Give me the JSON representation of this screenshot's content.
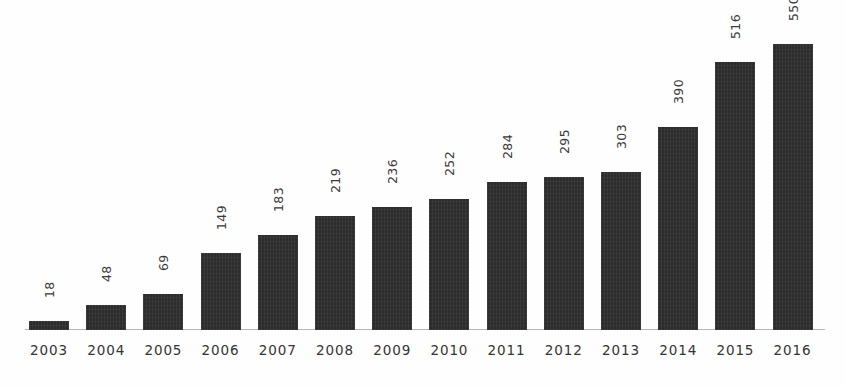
{
  "chart_data": {
    "type": "bar",
    "title": "",
    "subtitle": "",
    "xlabel": "",
    "ylabel": "",
    "categories": [
      "2003",
      "2004",
      "2005",
      "2006",
      "2007",
      "2008",
      "2009",
      "2010",
      "2011",
      "2012",
      "2013",
      "2014",
      "2015",
      "2016"
    ],
    "values": [
      18,
      48,
      69,
      149,
      183,
      219,
      236,
      252,
      284,
      295,
      303,
      390,
      516,
      550
    ],
    "value_labels": [
      "18",
      "48",
      "69",
      "149",
      "183",
      "219",
      "236",
      "252",
      "284",
      "295",
      "303",
      "390",
      "516",
      "550"
    ],
    "ylim": [
      0,
      550
    ],
    "grid": false,
    "legend": null,
    "annotations": [],
    "value_label_rotation": -90,
    "bar_color": "#2c2c2c",
    "axis_color": "#b9b9b9",
    "label_color": "#343434",
    "value_color": "#3a3a3a",
    "background_color": "#fefefe"
  }
}
